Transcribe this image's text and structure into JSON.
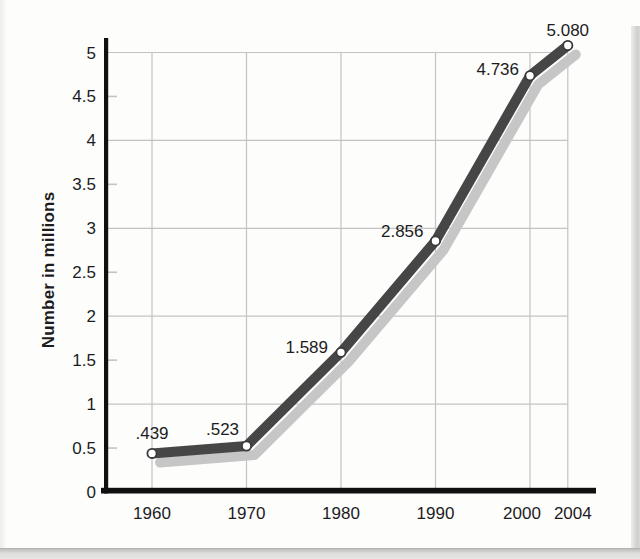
{
  "chart_data": {
    "type": "line",
    "title": "",
    "ylabel": "Number in millions",
    "xlabel": "",
    "x": [
      1960,
      1970,
      1980,
      1990,
      2000,
      2004
    ],
    "values": [
      0.439,
      0.523,
      1.589,
      2.856,
      4.736,
      5.08
    ],
    "point_labels": [
      ".439",
      ".523",
      "1.589",
      "2.856",
      "4.736",
      "5.080"
    ],
    "x_tick_labels": [
      "1960",
      "1970",
      "1980",
      "1990",
      "2000",
      "2004"
    ],
    "y_ticks": [
      0,
      0.5,
      1,
      1.5,
      2,
      2.5,
      3,
      3.5,
      4,
      4.5,
      5
    ],
    "y_tick_labels": [
      "0",
      "0.5",
      "1",
      "1.5",
      "2",
      "2.5",
      "3",
      "3.5",
      "4",
      "4.5",
      "5"
    ],
    "ylim": [
      0,
      5.3
    ],
    "xlim": [
      1954,
      2007
    ],
    "grid": "full gridlines at integer y-values and at every x tick; short tick stubs at half y-values",
    "legend": "none",
    "series_style": "thick dark gray line with light gray drop shadow and white circle markers",
    "colors": {
      "line": "#464646",
      "line_shadow": "#c6c6c6",
      "marker_fill": "#ffffff",
      "marker_stroke": "#3a3a3a",
      "gridline": "#c3c3c3",
      "axis": "#101010",
      "text": "#1c1c1c",
      "page_edge": "#d6d6d4"
    }
  }
}
